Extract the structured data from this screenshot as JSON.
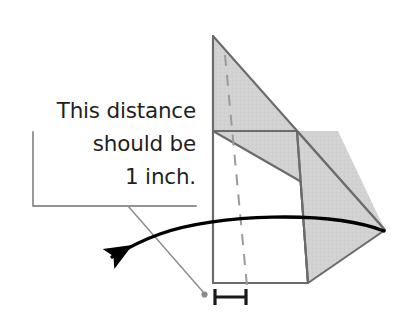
{
  "figure": {
    "kind": "instructional-geometry-diagram",
    "background_color": "#ffffff",
    "annotation": {
      "lines": [
        "This distance",
        "should be",
        "1 inch."
      ],
      "full_text": "This distance should be 1 inch.",
      "text_color": "#231f20",
      "align": "right"
    },
    "callout": {
      "bracket_color": "#6f6f6f",
      "leader_line_color": "#8a8a8a",
      "endpoint_dot_color": "#8a8a8a"
    },
    "arrow": {
      "color": "#000000",
      "direction": "right-to-left",
      "style": "curved",
      "label": "fold-motion-arrow"
    },
    "measure_bracket": {
      "color": "#1a1a1a",
      "span_label": "1 inch",
      "style": "capped-horizontal"
    },
    "solid": {
      "name": "folded-paper-wedge",
      "fill_color": "#d2d2d2",
      "stroke_color": "#6b6b6b",
      "hidden_edge_style": "dashed",
      "hidden_edge_color": "#9a9a9a",
      "faces": [
        {
          "name": "upper-triangle-face",
          "shaded": true
        },
        {
          "name": "lower-right-quadrilateral-face",
          "shaded": true
        },
        {
          "name": "front-rectangle-face",
          "shaded": false
        }
      ]
    }
  }
}
